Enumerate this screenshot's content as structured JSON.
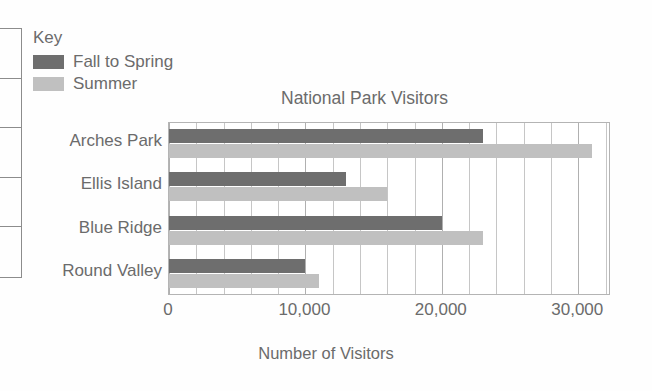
{
  "legend": {
    "title": "Key",
    "entries": [
      {
        "label": "Fall to Spring",
        "color": "#6e6e6e",
        "icon": "legend-swatch"
      },
      {
        "label": "Summer",
        "color": "#c0c0c0",
        "icon": "legend-swatch"
      }
    ]
  },
  "chart_data": {
    "type": "bar",
    "orientation": "horizontal",
    "title": "National Park Visitors",
    "xlabel": "Number of Visitors",
    "ylabel": "",
    "categories": [
      "Arches Park",
      "Ellis Island",
      "Blue Ridge",
      "Round Valley"
    ],
    "series": [
      {
        "name": "Fall to Spring",
        "color": "#6e6e6e",
        "values": [
          23000,
          13000,
          20000,
          10000
        ]
      },
      {
        "name": "Summer",
        "color": "#c0c0c0",
        "values": [
          31000,
          16000,
          23000,
          11000
        ]
      }
    ],
    "xlim": [
      0,
      32400
    ],
    "xticks": [
      0,
      10000,
      20000,
      30000
    ],
    "xticklabels": [
      "0",
      "10,000",
      "20,000",
      "30,000"
    ],
    "minor_tick_step": 2000,
    "grid": "vertical",
    "legend_position": "top-left-outside"
  },
  "axis": {
    "tick_labels": [
      "0",
      "10,000",
      "20,000",
      "30,000"
    ],
    "title": "Number of Visitors"
  },
  "edge_table": {
    "rows": 5
  }
}
